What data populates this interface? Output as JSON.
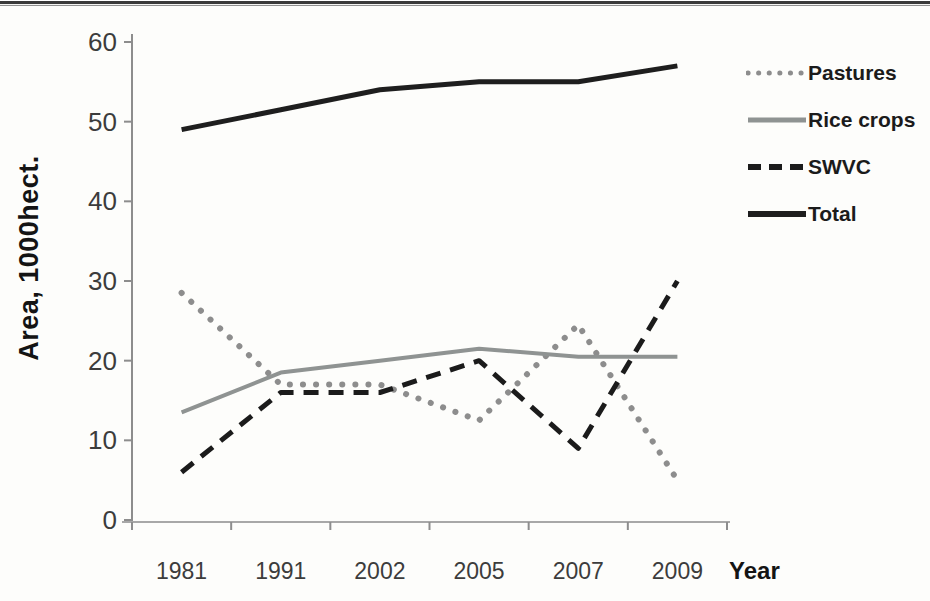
{
  "figure": {
    "background": "#fdfdfb",
    "top_border_color": "#3a3a3a"
  },
  "chart_data": {
    "type": "line",
    "title": "",
    "xlabel": "Year",
    "ylabel": "Area, 1000hect.",
    "categories": [
      "1981",
      "1991",
      "2002",
      "2005",
      "2007",
      "2009"
    ],
    "y_ticks": [
      0,
      10,
      20,
      30,
      40,
      50,
      60
    ],
    "ylim": [
      0,
      60
    ],
    "grid": false,
    "legend_position": "right",
    "axis_color": "#8d8d8d",
    "baseline_color": "#a8a8a8",
    "tick_label_color": "#3c3c3c",
    "series": [
      {
        "name": "Pastures",
        "style": "dotted",
        "color": "#8d8d8d",
        "width": 6,
        "values": [
          28.5,
          17,
          17,
          12.5,
          24.5,
          5
        ]
      },
      {
        "name": "Rice crops",
        "style": "solid",
        "color": "#8f9392",
        "width": 4,
        "values": [
          13.5,
          18.5,
          20,
          21.5,
          20.5,
          20.5
        ]
      },
      {
        "name": "SWVC",
        "style": "dashed",
        "color": "#1b1b1b",
        "width": 5,
        "values": [
          6,
          16,
          16,
          20,
          9,
          30
        ]
      },
      {
        "name": "Total",
        "style": "solid",
        "color": "#1e1e1e",
        "width": 5,
        "values": [
          49,
          51.5,
          54,
          55,
          55,
          57
        ]
      }
    ]
  }
}
